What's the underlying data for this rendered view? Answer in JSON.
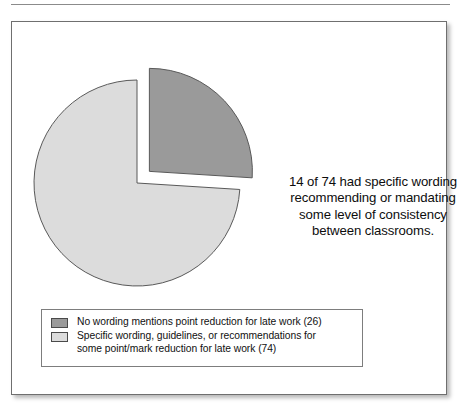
{
  "figure": {
    "background_color": "#ffffff",
    "border_color": "#6f6f6f",
    "top_rule_color": "#8b8b8b"
  },
  "annotation": {
    "text": "14 of 74 had specific wording recommending or mandating some level of consistency between classrooms."
  },
  "legend": {
    "items": [
      {
        "swatch_name": "legend-swatch-dark",
        "color": "#9a9a9a",
        "label": "No wording mentions point reduction for late work (26)"
      },
      {
        "swatch_name": "legend-swatch-light",
        "color": "#dcdcdc",
        "label": "Specific wording, guidelines, or recommendations for\nsome point/mark reduction for late work (74)"
      }
    ]
  },
  "chart_data": {
    "type": "pie",
    "title": "",
    "labels": [
      "No wording mentions point reduction for late work (26)",
      "Specific wording, guidelines, or recommendations for some point/mark reduction for late work (74)"
    ],
    "values": [
      26,
      74
    ],
    "value_unit": "percent",
    "colors": [
      "#9a9a9a",
      "#dcdcdc"
    ],
    "slice_edge_color": "#595959",
    "start_angle_deg": 0,
    "direction": "clockwise",
    "exploded": [
      true,
      false
    ],
    "explode_offset_px": 17,
    "legend_position": "bottom-left",
    "grid": false,
    "annotations": [
      "14 of 74 had specific wording recommending or mandating some level of consistency between classrooms."
    ]
  }
}
